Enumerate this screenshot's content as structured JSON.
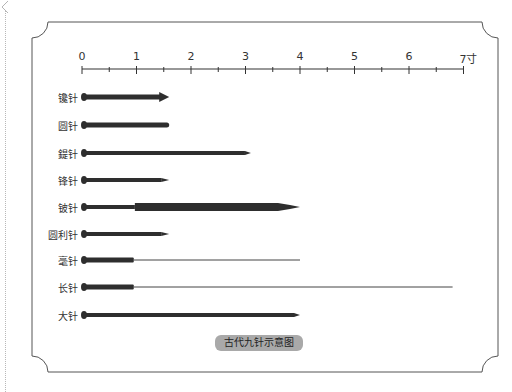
{
  "diagram": {
    "caption": "古代九针示意图",
    "ruler": {
      "unit_label": "寸",
      "ticks": [
        "0",
        "1",
        "2",
        "3",
        "4",
        "5",
        "6",
        "7寸"
      ],
      "origin_x": 82,
      "unit_px": 54.5
    },
    "needles": [
      {
        "name": "镵针",
        "length": 1.6,
        "style": "arrow"
      },
      {
        "name": "圆针",
        "length": 1.6,
        "style": "round"
      },
      {
        "name": "鍉针",
        "length": 3.1,
        "style": "blunt-point"
      },
      {
        "name": "锋针",
        "length": 1.6,
        "style": "sharp-point"
      },
      {
        "name": "铍针",
        "length": 4.0,
        "style": "sword"
      },
      {
        "name": "圆利针",
        "length": 1.6,
        "style": "sharp-point"
      },
      {
        "name": "毫针",
        "length": 4.0,
        "style": "filiform"
      },
      {
        "name": "长针",
        "length": 6.8,
        "style": "filiform"
      },
      {
        "name": "大针",
        "length": 4.0,
        "style": "blunt-point"
      }
    ]
  },
  "colors": {
    "needle": "#2e2e2e",
    "frame": "#555555",
    "caption_bg": "#a9a9a9"
  }
}
